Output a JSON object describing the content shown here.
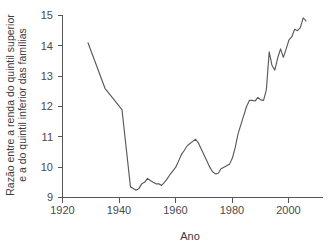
{
  "figure": {
    "background_color": "#ffffff",
    "line_color": "#5a5a5a",
    "axis_color": "#555555",
    "text_color": "#3c3c3c"
  },
  "axes": {
    "x_title": "Ano",
    "y_title_line1": "Razão entre a renda do quintil superior",
    "y_title_line2": "e a do quintil inferior das famílias",
    "x_ticks": [
      "1920",
      "1940",
      "1960",
      "1980",
      "2000"
    ],
    "y_ticks": [
      "9",
      "10",
      "11",
      "12",
      "13",
      "14",
      "15"
    ]
  },
  "chart_data": {
    "type": "line",
    "title": "",
    "xlabel": "Ano",
    "ylabel": "Razão entre a renda do quintil superior e a do quintil inferior das famílias",
    "xlim": [
      1920,
      2012
    ],
    "ylim": [
      9,
      15
    ],
    "grid": false,
    "legend": "none",
    "x_tick_values": [
      1920,
      1940,
      1960,
      1980,
      2000
    ],
    "y_tick_values": [
      9,
      10,
      11,
      12,
      13,
      14,
      15
    ],
    "series": [
      {
        "name": "Razão quintil superior / quintil inferior",
        "color": "#5a5a5a",
        "x": [
          1929,
          1935,
          1941,
          1944,
          1945,
          1946,
          1947,
          1948,
          1949,
          1950,
          1951,
          1952,
          1953,
          1954,
          1955,
          1956,
          1957,
          1958,
          1959,
          1960,
          1961,
          1962,
          1963,
          1964,
          1965,
          1966,
          1967,
          1968,
          1969,
          1970,
          1971,
          1972,
          1973,
          1974,
          1975,
          1976,
          1977,
          1978,
          1979,
          1980,
          1981,
          1982,
          1983,
          1984,
          1985,
          1986,
          1987,
          1988,
          1989,
          1990,
          1991,
          1992,
          1993,
          1994,
          1995,
          1996,
          1997,
          1998,
          1999,
          2000,
          2001,
          2002,
          2003,
          2004,
          2005,
          2006
        ],
        "y": [
          14.1,
          12.6,
          11.9,
          9.35,
          9.3,
          9.24,
          9.3,
          9.45,
          9.5,
          9.63,
          9.56,
          9.5,
          9.45,
          9.45,
          9.4,
          9.5,
          9.62,
          9.76,
          9.88,
          10.0,
          10.2,
          10.42,
          10.55,
          10.7,
          10.78,
          10.85,
          10.92,
          10.8,
          10.6,
          10.4,
          10.2,
          10.0,
          9.85,
          9.78,
          9.8,
          9.95,
          10.0,
          10.05,
          10.1,
          10.3,
          10.65,
          11.1,
          11.4,
          11.7,
          12.0,
          12.2,
          12.2,
          12.18,
          12.3,
          12.22,
          12.2,
          12.55,
          13.8,
          13.35,
          13.2,
          13.6,
          13.9,
          13.62,
          13.9,
          14.2,
          14.3,
          14.55,
          14.5,
          14.6,
          14.92,
          14.82
        ]
      }
    ]
  }
}
